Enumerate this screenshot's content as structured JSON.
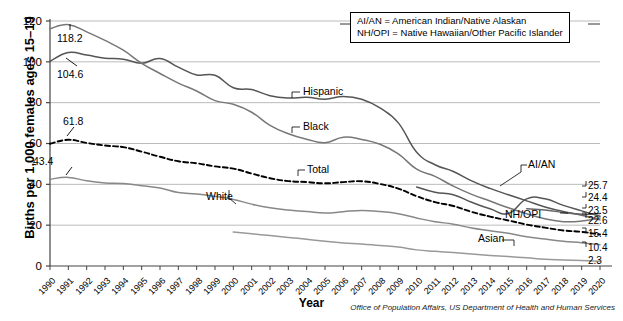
{
  "chart_data": {
    "type": "line",
    "title": "",
    "xlabel": "Year",
    "ylabel": "Births per 1,000 females ages 15–19",
    "xlim": [
      1990,
      2020
    ],
    "ylim": [
      0,
      120
    ],
    "yticks": [
      0,
      20,
      40,
      60,
      80,
      100,
      120
    ],
    "grid": true,
    "legend_position": "inline-labels",
    "x": [
      1990,
      1991,
      1992,
      1993,
      1994,
      1995,
      1996,
      1997,
      1998,
      1999,
      2000,
      2001,
      2002,
      2003,
      2004,
      2005,
      2006,
      2007,
      2008,
      2009,
      2010,
      2011,
      2012,
      2013,
      2014,
      2015,
      2016,
      2017,
      2018,
      2019,
      2020
    ],
    "categories": [
      "1990",
      "1991",
      "1992",
      "1993",
      "1994",
      "1995",
      "1996",
      "1997",
      "1998",
      "1999",
      "2000",
      "2001",
      "2002",
      "2003",
      "2004",
      "2005",
      "2006",
      "2007",
      "2008",
      "2009",
      "2010",
      "2011",
      "2012",
      "2013",
      "2014",
      "2015",
      "2016",
      "2017",
      "2018",
      "2019",
      "2020"
    ],
    "series": [
      {
        "name": "Hispanic",
        "style": "solid",
        "color": "#555555",
        "end_value": 25.7,
        "values": [
          100.3,
          104.6,
          103.3,
          101.8,
          101.3,
          99.3,
          101.6,
          97.4,
          93.6,
          93.4,
          87.3,
          86.4,
          83.4,
          82.3,
          82.6,
          81.7,
          83.0,
          81.7,
          77.4,
          70.1,
          55.7,
          49.6,
          46.3,
          41.7,
          38.0,
          34.9,
          31.9,
          28.9,
          26.7,
          25.3,
          25.7
        ]
      },
      {
        "name": "Black",
        "style": "solid",
        "color": "#777777",
        "end_value": 23.5,
        "values": [
          116.2,
          118.2,
          114.7,
          110.5,
          105.7,
          99.3,
          94.3,
          89.6,
          85.7,
          81.0,
          79.2,
          75.3,
          68.9,
          64.8,
          62.1,
          60.4,
          63.1,
          62.0,
          59.6,
          54.9,
          47.4,
          43.9,
          39.1,
          35.1,
          31.8,
          28.5,
          25.6,
          23.1,
          21.7,
          22.0,
          23.5
        ]
      },
      {
        "name": "Total",
        "style": "dashed",
        "color": "#000000",
        "end_value": 15.4,
        "values": [
          59.9,
          61.8,
          60.3,
          59.0,
          58.2,
          56.0,
          53.5,
          51.3,
          50.3,
          48.8,
          47.7,
          45.3,
          43.0,
          41.6,
          41.1,
          40.5,
          41.1,
          41.5,
          40.2,
          37.9,
          34.2,
          31.3,
          29.4,
          26.5,
          24.2,
          22.3,
          20.3,
          18.8,
          17.4,
          16.7,
          15.4
        ]
      },
      {
        "name": "White",
        "style": "solid",
        "color": "#888888",
        "end_value": 10.4,
        "values": [
          42.5,
          43.4,
          41.7,
          40.7,
          40.4,
          39.3,
          38.2,
          36.0,
          35.3,
          34.1,
          32.6,
          30.3,
          28.5,
          27.4,
          26.7,
          25.9,
          26.6,
          27.2,
          26.7,
          25.6,
          23.5,
          21.7,
          20.5,
          18.6,
          17.3,
          16.0,
          14.3,
          13.2,
          12.1,
          11.4,
          10.4
        ]
      },
      {
        "name": "AI/AN",
        "style": "solid",
        "color": "#555555",
        "end_value": 24.4,
        "short_series": true,
        "values": [
          null,
          null,
          null,
          null,
          null,
          null,
          null,
          null,
          null,
          null,
          null,
          null,
          null,
          null,
          null,
          null,
          null,
          null,
          null,
          null,
          38.7,
          36.1,
          34.9,
          31.2,
          28.0,
          25.7,
          32.9,
          32.9,
          29.7,
          27.0,
          24.4
        ]
      },
      {
        "name": "NH/OPI",
        "style": "solid",
        "color": "#666666",
        "end_value": 22.6,
        "short_series": true,
        "values": [
          null,
          null,
          null,
          null,
          null,
          null,
          null,
          null,
          null,
          null,
          null,
          null,
          null,
          null,
          null,
          null,
          null,
          null,
          null,
          null,
          null,
          null,
          null,
          null,
          null,
          null,
          28.1,
          27.4,
          26.2,
          24.9,
          22.6
        ]
      },
      {
        "name": "Asian",
        "style": "solid",
        "color": "#999999",
        "end_value": 2.3,
        "values": [
          null,
          null,
          null,
          null,
          null,
          null,
          null,
          null,
          null,
          null,
          16.6,
          15.8,
          14.9,
          14.0,
          13.1,
          12.1,
          11.3,
          10.8,
          10.0,
          9.3,
          7.9,
          7.2,
          6.6,
          5.9,
          5.2,
          4.6,
          4.0,
          3.3,
          3.0,
          2.7,
          2.3
        ]
      }
    ],
    "annotations": [
      {
        "text": "118.2",
        "series": "Black",
        "year": 1991,
        "value": 118.2
      },
      {
        "text": "104.6",
        "series": "Hispanic",
        "year": 1991,
        "value": 104.6
      },
      {
        "text": "61.8",
        "series": "Total",
        "year": 1991,
        "value": 61.8
      },
      {
        "text": "43.4",
        "series": "White",
        "year": 1991,
        "value": 43.4
      }
    ],
    "end_labels": [
      {
        "text": "25.7",
        "series": "Hispanic"
      },
      {
        "text": "24.4",
        "series": "AI/AN"
      },
      {
        "text": "23.5",
        "series": "Black"
      },
      {
        "text": "22.6",
        "series": "NH/OPI"
      },
      {
        "text": "15.4",
        "series": "Total"
      },
      {
        "text": "10.4",
        "series": "White"
      },
      {
        "text": "2.3",
        "series": "Asian"
      }
    ],
    "inline_labels": [
      "Hispanic",
      "Black",
      "Total",
      "White",
      "AI/AN",
      "NH/OPI",
      "Asian"
    ]
  },
  "legend_box": {
    "line1": "AI/AN = American Indian/Native Alaskan",
    "line2": "NH/OPI = Native Hawaiian/Other Pacific Islander"
  },
  "axis": {
    "y_title": "Births per 1,000 females ages 15–19",
    "x_title": "Year",
    "y_ticks": [
      "0",
      "20",
      "40",
      "60",
      "80",
      "100",
      "120"
    ],
    "x_ticks": [
      "1990",
      "1991",
      "1992",
      "1993",
      "1994",
      "1995",
      "1996",
      "1997",
      "1998",
      "1999",
      "2000",
      "2001",
      "2002",
      "2003",
      "2004",
      "2005",
      "2006",
      "2007",
      "2008",
      "2009",
      "2010",
      "2011",
      "2012",
      "2013",
      "2014",
      "2015",
      "2016",
      "2017",
      "2018",
      "2019",
      "2020"
    ]
  },
  "series_labels": {
    "hispanic": "Hispanic",
    "black": "Black",
    "total": "Total",
    "white": "White",
    "aian": "AI/AN",
    "nhopi": "NH/OPI",
    "asian": "Asian"
  },
  "annotation_values": {
    "peak_black": "118.2",
    "peak_hispanic": "104.6",
    "peak_total": "61.8",
    "peak_white": "43.4"
  },
  "end_values": {
    "v1": "25.7",
    "v2": "24.4",
    "v3": "23.5",
    "v4": "22.6",
    "v5": "15.4",
    "v6": "10.4",
    "v7": "2.3"
  },
  "footer": {
    "source": "Office of Population Affairs, US Department of Health and Human Services"
  },
  "colors": {
    "grid": "#bbbbbb",
    "axis": "#444444",
    "total_line": "#000000",
    "background": "#ffffff"
  }
}
